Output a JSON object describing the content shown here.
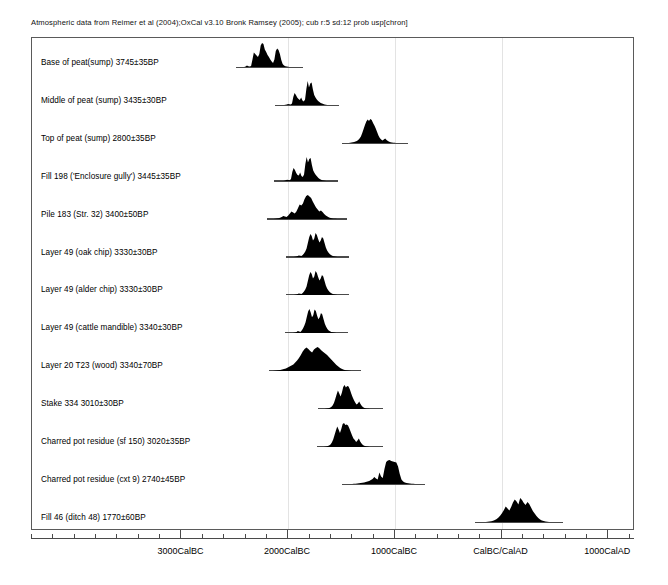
{
  "figure": {
    "caption": "Atmospheric data from Reimer et al (2004);OxCal v3.10 Bronk Ramsey (2005); cub r:5 sd:12 prob usp[chron]",
    "width": 668,
    "height": 585
  },
  "chart_data": {
    "type": "area",
    "title": "Atmospheric data from Reimer et al (2004);OxCal v3.10 Bronk Ramsey (2005); cub r:5 sd:12 prob usp[chron]",
    "xlabel": "",
    "ylabel": "",
    "grid": true,
    "legend": "none",
    "axis": {
      "unit": "calendar years",
      "xlim": [
        -4400,
        1250
      ],
      "tick_labels": [
        "3000CalBC",
        "2000CalBC",
        "1000CalBC",
        "CalBC/CalAD",
        "1000CalAD"
      ],
      "tick_values": [
        -3000,
        -2000,
        -1000,
        0,
        1000
      ],
      "minor_tick_interval": 200
    },
    "gridlines": [
      -2000,
      -1000,
      0
    ],
    "series": [
      {
        "name": "Base of peat(sump)",
        "label": "Base of peat(sump)  3745±35BP",
        "bp_age": 3745,
        "bp_error": 35,
        "range_start": -2490,
        "range_end": -1860,
        "peak_start": -2270,
        "peak_end": -2000,
        "profile": [
          0,
          0,
          0,
          0,
          0,
          0,
          0,
          2,
          6,
          3,
          2,
          4,
          30,
          58,
          52,
          46,
          40,
          52,
          86,
          96,
          92,
          70,
          60,
          48,
          40,
          30,
          22,
          16,
          30,
          64,
          74,
          68,
          52,
          28,
          12,
          6,
          3,
          2,
          1,
          0,
          0,
          0,
          0,
          0,
          0,
          0,
          0,
          0,
          0,
          0
        ]
      },
      {
        "name": "Middle of peat (sump)",
        "label": "Middle of peat (sump)  3435±30BP",
        "bp_age": 3435,
        "bp_error": 30,
        "range_start": -2120,
        "range_end": -1520,
        "peak_start": -1880,
        "peak_end": -1640,
        "profile": [
          0,
          0,
          0,
          0,
          0,
          0,
          0,
          0,
          1,
          2,
          4,
          3,
          2,
          6,
          32,
          48,
          40,
          30,
          24,
          20,
          30,
          18,
          14,
          22,
          64,
          96,
          70,
          86,
          90,
          62,
          40,
          30,
          22,
          16,
          12,
          8,
          6,
          4,
          2,
          1,
          0,
          0,
          0,
          0,
          0,
          0,
          0,
          0,
          0,
          0
        ]
      },
      {
        "name": "Top of peat (sump)",
        "label": "Top of peat (sump)  2800±35BP",
        "bp_age": 2800,
        "bp_error": 35,
        "range_start": -1500,
        "range_end": -880,
        "peak_start": -1270,
        "peak_end": -1070,
        "profile": [
          0,
          0,
          0,
          0,
          0,
          0,
          1,
          2,
          3,
          4,
          6,
          8,
          12,
          18,
          26,
          40,
          56,
          72,
          86,
          94,
          88,
          96,
          92,
          80,
          70,
          58,
          44,
          30,
          20,
          14,
          10,
          14,
          18,
          12,
          8,
          5,
          3,
          2,
          1,
          1,
          0,
          0,
          0,
          0,
          0,
          0,
          0,
          0,
          0,
          0
        ]
      },
      {
        "name": "Fill 198 ('Enclosure gully')",
        "label": "Fill 198 ('Enclosure gully')  3445±35BP",
        "bp_age": 3445,
        "bp_error": 35,
        "range_start": -2130,
        "range_end": -1530,
        "peak_start": -1890,
        "peak_end": -1650,
        "profile": [
          0,
          0,
          0,
          0,
          0,
          0,
          0,
          0,
          1,
          3,
          5,
          4,
          3,
          8,
          36,
          52,
          44,
          32,
          24,
          22,
          34,
          20,
          16,
          26,
          68,
          96,
          74,
          88,
          92,
          64,
          42,
          32,
          24,
          18,
          12,
          8,
          5,
          3,
          2,
          1,
          0,
          0,
          0,
          0,
          0,
          0,
          0,
          0,
          0,
          0
        ]
      },
      {
        "name": "Pile 183 (Str. 32)",
        "label": "Pile 183 (Str. 32)  3400±50BP",
        "bp_age": 3400,
        "bp_error": 50,
        "range_start": -2200,
        "range_end": -1450,
        "peak_start": -1880,
        "peak_end": -1610,
        "profile": [
          0,
          0,
          0,
          0,
          0,
          1,
          2,
          3,
          5,
          8,
          12,
          10,
          8,
          14,
          22,
          30,
          26,
          22,
          30,
          44,
          58,
          54,
          62,
          80,
          92,
          96,
          90,
          84,
          70,
          58,
          46,
          38,
          30,
          34,
          28,
          20,
          14,
          10,
          6,
          4,
          2,
          1,
          1,
          0,
          0,
          0,
          0,
          0,
          0,
          0
        ]
      },
      {
        "name": "Layer 49 (oak chip)",
        "label": "Layer 49 (oak chip)  3330±30BP",
        "bp_age": 3330,
        "bp_error": 30,
        "range_start": -2020,
        "range_end": -1430,
        "peak_start": -1740,
        "peak_end": -1520,
        "profile": [
          0,
          0,
          0,
          0,
          0,
          0,
          0,
          1,
          2,
          4,
          6,
          5,
          4,
          8,
          14,
          22,
          34,
          56,
          78,
          92,
          84,
          66,
          74,
          96,
          88,
          72,
          58,
          66,
          80,
          74,
          56,
          38,
          26,
          18,
          12,
          8,
          5,
          3,
          2,
          1,
          0,
          0,
          0,
          0,
          0,
          0,
          0,
          0,
          0,
          0
        ]
      },
      {
        "name": "Layer 49 (alder chip)",
        "label": "Layer 49 (alder chip)  3330±30BP",
        "bp_age": 3330,
        "bp_error": 30,
        "range_start": -2020,
        "range_end": -1430,
        "peak_start": -1740,
        "peak_end": -1520,
        "profile": [
          0,
          0,
          0,
          0,
          0,
          0,
          0,
          1,
          2,
          4,
          6,
          5,
          4,
          8,
          14,
          22,
          34,
          56,
          78,
          92,
          84,
          66,
          74,
          96,
          88,
          72,
          58,
          66,
          80,
          74,
          56,
          38,
          26,
          18,
          12,
          8,
          5,
          3,
          2,
          1,
          0,
          0,
          0,
          0,
          0,
          0,
          0,
          0,
          0,
          0
        ]
      },
      {
        "name": "Layer 49 (cattle mandible)",
        "label": "Layer 49 (cattle mandible)  3340±30BP",
        "bp_age": 3340,
        "bp_error": 30,
        "range_start": -2030,
        "range_end": -1440,
        "peak_start": -1750,
        "peak_end": -1530,
        "profile": [
          0,
          0,
          0,
          0,
          0,
          0,
          0,
          1,
          2,
          4,
          8,
          6,
          4,
          10,
          18,
          28,
          42,
          64,
          84,
          94,
          80,
          62,
          70,
          92,
          86,
          68,
          54,
          62,
          78,
          72,
          54,
          36,
          24,
          16,
          10,
          7,
          4,
          3,
          2,
          1,
          0,
          0,
          0,
          0,
          0,
          0,
          0,
          0,
          0,
          0
        ]
      },
      {
        "name": "Layer 20 T23 (wood)",
        "label": "Layer 20 T23 (wood)  3340±70BP",
        "bp_age": 3340,
        "bp_error": 70,
        "range_start": -2180,
        "range_end": -1320,
        "peak_start": -1800,
        "peak_end": -1490,
        "profile": [
          0,
          0,
          0,
          1,
          2,
          3,
          4,
          6,
          8,
          10,
          14,
          18,
          22,
          26,
          34,
          42,
          52,
          64,
          78,
          88,
          94,
          88,
          80,
          74,
          86,
          92,
          96,
          90,
          82,
          76,
          70,
          64,
          56,
          48,
          40,
          32,
          24,
          18,
          12,
          8,
          5,
          3,
          2,
          1,
          0,
          0,
          0,
          0,
          0,
          0
        ]
      },
      {
        "name": "Stake 334",
        "label": "Stake 334  3010±30BP",
        "bp_age": 3010,
        "bp_error": 30,
        "range_start": -1720,
        "range_end": -1110,
        "peak_start": -1450,
        "peak_end": -1250,
        "profile": [
          0,
          0,
          0,
          0,
          0,
          0,
          1,
          2,
          3,
          5,
          8,
          14,
          24,
          40,
          58,
          74,
          62,
          50,
          66,
          88,
          96,
          86,
          92,
          90,
          78,
          62,
          48,
          36,
          26,
          18,
          22,
          30,
          20,
          12,
          7,
          4,
          2,
          1,
          1,
          0,
          0,
          0,
          0,
          0,
          0,
          0,
          0,
          0,
          0,
          0
        ]
      },
      {
        "name": "Charred pot residue (sf 150)",
        "label": "Charred pot residue (sf 150)  3020±35BP",
        "bp_age": 3020,
        "bp_error": 35,
        "range_start": -1730,
        "range_end": -1110,
        "peak_start": -1460,
        "peak_end": -1250,
        "profile": [
          0,
          0,
          0,
          0,
          0,
          0,
          1,
          2,
          4,
          6,
          10,
          18,
          30,
          48,
          66,
          82,
          70,
          56,
          72,
          92,
          96,
          88,
          90,
          86,
          74,
          60,
          46,
          34,
          28,
          20,
          26,
          34,
          22,
          14,
          8,
          5,
          3,
          2,
          1,
          0,
          0,
          0,
          0,
          0,
          0,
          0,
          0,
          0,
          0,
          0
        ]
      },
      {
        "name": "Charred pot residue (cxt 9)",
        "label": "Charred pot residue (cxt 9)  2740±45BP",
        "bp_age": 2740,
        "bp_error": 45,
        "range_start": -1500,
        "range_end": -720,
        "peak_start": -1010,
        "peak_end": -830,
        "profile": [
          0,
          0,
          0,
          0,
          0,
          0,
          0,
          1,
          1,
          2,
          3,
          4,
          5,
          6,
          8,
          10,
          12,
          16,
          20,
          28,
          22,
          18,
          46,
          30,
          24,
          60,
          88,
          94,
          96,
          92,
          90,
          88,
          86,
          70,
          40,
          18,
          10,
          6,
          4,
          3,
          2,
          1,
          1,
          0,
          0,
          0,
          0,
          0,
          0,
          0
        ]
      },
      {
        "name": "Fill 46 (ditch 48)",
        "label": "Fill 46 (ditch 48)  1770±60BP",
        "bp_age": 1770,
        "bp_error": 60,
        "range_start": -250,
        "range_end": 580,
        "peak_start": 120,
        "peak_end": 420,
        "profile": [
          0,
          0,
          0,
          0,
          0,
          0,
          0,
          1,
          2,
          3,
          5,
          8,
          12,
          18,
          26,
          36,
          48,
          62,
          54,
          46,
          60,
          78,
          90,
          82,
          70,
          96,
          88,
          76,
          68,
          80,
          72,
          58,
          44,
          34,
          24,
          16,
          10,
          6,
          4,
          2,
          1,
          0,
          0,
          0,
          0,
          0,
          0,
          0,
          0,
          0
        ]
      }
    ]
  }
}
